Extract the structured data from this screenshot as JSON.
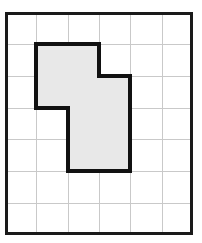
{
  "figure": {
    "background_color": "#ffffff"
  },
  "grid": {
    "columns": 6,
    "rows": 7,
    "cell_size": 31,
    "origin_x": 5,
    "origin_y": 12,
    "line_color": "#c9c9c9",
    "line_width": 1,
    "border_color": "#1a1a1a",
    "border_width": 3,
    "border_x": 5,
    "border_y": 12,
    "border_width_px": 188,
    "border_height_px": 223
  },
  "shape": {
    "name": "shaded-polygon",
    "fill_color": "#e8e8e8",
    "stroke_color": "#111111",
    "stroke_width": 4,
    "area_cells": 6,
    "perimeter_cells": 12,
    "vertices_grid": [
      [
        1,
        1
      ],
      [
        3,
        1
      ],
      [
        3,
        2
      ],
      [
        4,
        2
      ],
      [
        4,
        5
      ],
      [
        2,
        5
      ],
      [
        2,
        3
      ],
      [
        1,
        3
      ]
    ],
    "points_px": "36,43 98,43 98,74 129,74 129,167 67,167 67,105 36,105",
    "filled_cells": [
      [
        1,
        1
      ],
      [
        2,
        1
      ],
      [
        1,
        2
      ],
      [
        2,
        2
      ],
      [
        3,
        2
      ],
      [
        2,
        3
      ],
      [
        3,
        3
      ],
      [
        2,
        4
      ],
      [
        3,
        4
      ]
    ]
  }
}
